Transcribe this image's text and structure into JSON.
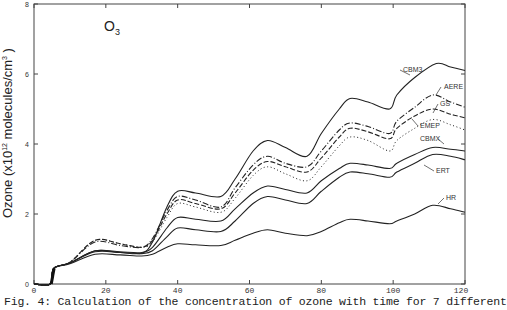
{
  "chart_data": {
    "type": "line",
    "title": "O3",
    "title_main": "O",
    "title_sub": "3",
    "xlabel": "",
    "ylabel": "Ozone (x10^12 molecules/cm^3)",
    "ylabel_parts": {
      "prefix": "Ozone (x10",
      "exp": "12",
      "mid": " molecules/cm",
      "exp2": "3",
      "suffix": " )"
    },
    "xlim": [
      0,
      120
    ],
    "ylim": [
      0,
      8
    ],
    "x_ticks": [
      0,
      20,
      40,
      60,
      80,
      100,
      120
    ],
    "y_ticks": [
      0,
      2,
      4,
      6,
      8
    ],
    "grid": false,
    "legend": "inline labels at right end of curves",
    "series": [
      {
        "name": "CBM3",
        "style": "solid",
        "x": [
          0,
          4.5,
          5.5,
          10,
          17,
          24,
          30,
          33,
          37,
          40,
          45,
          52,
          56,
          61,
          65,
          70,
          76,
          80,
          85,
          88,
          93,
          99,
          101,
          106,
          112,
          116,
          120
        ],
        "y": [
          0,
          0,
          0.45,
          0.6,
          0.95,
          0.9,
          0.88,
          1.2,
          2.2,
          2.65,
          2.6,
          2.5,
          3.0,
          3.8,
          4.1,
          3.9,
          3.65,
          4.3,
          5.0,
          5.3,
          5.2,
          5.0,
          5.4,
          5.9,
          6.3,
          6.2,
          6.1
        ]
      },
      {
        "name": "AERE",
        "style": "dash-dot",
        "x": [
          0,
          4.5,
          5.5,
          10,
          17,
          24,
          30,
          33,
          37,
          40,
          45,
          52,
          56,
          61,
          65,
          70,
          76,
          80,
          85,
          88,
          93,
          99,
          101,
          106,
          111,
          116,
          120
        ],
        "y": [
          0,
          0,
          0.45,
          0.62,
          1.2,
          1.1,
          1.05,
          1.3,
          2.1,
          2.5,
          2.4,
          2.2,
          2.75,
          3.4,
          3.65,
          3.45,
          3.35,
          3.8,
          4.4,
          4.6,
          4.5,
          4.3,
          4.65,
          5.05,
          5.4,
          5.2,
          5.05
        ]
      },
      {
        "name": "GS",
        "style": "dashed",
        "x": [
          0,
          4.5,
          5.5,
          10,
          17,
          24,
          30,
          33,
          37,
          40,
          45,
          52,
          56,
          61,
          65,
          70,
          76,
          80,
          85,
          88,
          93,
          99,
          101,
          106,
          111,
          116,
          120
        ],
        "y": [
          0,
          0,
          0.45,
          0.62,
          1.25,
          1.15,
          1.05,
          1.25,
          2.0,
          2.4,
          2.3,
          2.15,
          2.6,
          3.25,
          3.5,
          3.35,
          3.2,
          3.6,
          4.2,
          4.45,
          4.35,
          4.15,
          4.45,
          4.8,
          5.0,
          4.85,
          4.75
        ]
      },
      {
        "name": "EMEP",
        "style": "dotted",
        "x": [
          0,
          4.5,
          5.5,
          10,
          17,
          24,
          30,
          33,
          37,
          40,
          45,
          52,
          56,
          61,
          65,
          70,
          76,
          80,
          85,
          88,
          93,
          99,
          101,
          106,
          111,
          116,
          120
        ],
        "y": [
          0,
          0,
          0.45,
          0.62,
          1.25,
          1.15,
          1.05,
          1.2,
          1.9,
          2.3,
          2.2,
          2.05,
          2.45,
          3.1,
          3.35,
          3.15,
          2.95,
          3.35,
          3.95,
          4.2,
          4.1,
          3.8,
          4.1,
          4.45,
          4.7,
          4.55,
          4.4
        ]
      },
      {
        "name": "CBMX",
        "style": "solid",
        "x": [
          0,
          4.5,
          5.5,
          10,
          17,
          24,
          30,
          33,
          37,
          40,
          45,
          52,
          56,
          61,
          65,
          70,
          76,
          80,
          85,
          88,
          93,
          99,
          101,
          106,
          111,
          116,
          120
        ],
        "y": [
          0,
          0,
          0.45,
          0.6,
          0.95,
          0.92,
          0.9,
          1.05,
          1.6,
          1.9,
          1.85,
          1.8,
          2.15,
          2.6,
          2.8,
          2.7,
          2.6,
          2.95,
          3.3,
          3.45,
          3.4,
          3.3,
          3.45,
          3.7,
          3.9,
          3.85,
          3.8
        ]
      },
      {
        "name": "ERT",
        "style": "solid",
        "x": [
          0,
          4.5,
          5.5,
          10,
          17,
          24,
          30,
          33,
          37,
          40,
          45,
          52,
          56,
          61,
          65,
          70,
          76,
          80,
          85,
          88,
          93,
          99,
          101,
          106,
          111,
          116,
          120
        ],
        "y": [
          0,
          0,
          0.45,
          0.6,
          0.92,
          0.9,
          0.87,
          0.95,
          1.35,
          1.6,
          1.55,
          1.5,
          1.8,
          2.3,
          2.5,
          2.4,
          2.3,
          2.65,
          3.05,
          3.2,
          3.15,
          3.05,
          3.2,
          3.45,
          3.7,
          3.65,
          3.55
        ]
      },
      {
        "name": "HR",
        "style": "solid",
        "x": [
          0,
          4.5,
          5.5,
          10,
          17,
          24,
          30,
          33,
          37,
          40,
          45,
          52,
          56,
          61,
          65,
          70,
          76,
          80,
          85,
          88,
          93,
          99,
          101,
          106,
          111,
          116,
          120
        ],
        "y": [
          0,
          0,
          0.45,
          0.58,
          0.85,
          0.83,
          0.8,
          0.85,
          1.05,
          1.15,
          1.12,
          1.1,
          1.25,
          1.45,
          1.55,
          1.45,
          1.38,
          1.5,
          1.75,
          1.85,
          1.8,
          1.72,
          1.8,
          2.0,
          2.25,
          2.15,
          2.05
        ]
      }
    ],
    "labels": [
      {
        "text": "CBM3",
        "x_px": 403,
        "y_px": 72
      },
      {
        "text": "AERE",
        "x_px": 444,
        "y_px": 89
      },
      {
        "text": "GS",
        "x_px": 440,
        "y_px": 106
      },
      {
        "text": "EMEP",
        "x_px": 420,
        "y_px": 128
      },
      {
        "text": "CBMX",
        "x_px": 420,
        "y_px": 141
      },
      {
        "text": "ERT",
        "x_px": 436,
        "y_px": 173
      },
      {
        "text": "HR",
        "x_px": 446,
        "y_px": 200
      }
    ]
  },
  "caption": "Fig. 4: Calculation of the concentration of ozone  with time for 7 different"
}
